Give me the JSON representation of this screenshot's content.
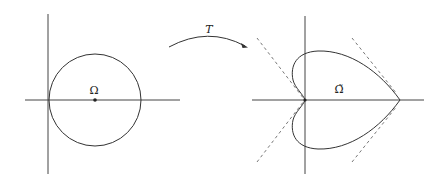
{
  "diagram": {
    "left_panel": {
      "region_label": "Ω",
      "shape": "circle",
      "center_marker": "dot"
    },
    "mapping": {
      "label": "T",
      "arrow": "curved-arrow-right"
    },
    "right_panel": {
      "region_label": "Ω̃",
      "shape": "heart-shaped curve with cusp at origin",
      "tangent_lines": "dashed"
    },
    "colors": {
      "stroke": "#333333",
      "background": "#ffffff"
    }
  }
}
